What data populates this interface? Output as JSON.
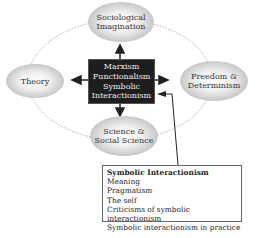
{
  "center": {
    "lines": [
      "Marxism",
      "Functionalism",
      "Symbolic",
      "Interactionism"
    ]
  },
  "nodes": {
    "top": {
      "lines": [
        "Sociological",
        "Imagination"
      ]
    },
    "left": {
      "lines": [
        "Theory"
      ]
    },
    "right": {
      "lines": [
        "Freedom &",
        "Determinism"
      ]
    },
    "bottom": {
      "lines": [
        "Science &",
        "Social Science"
      ]
    }
  },
  "info_box": {
    "title": "Symbolic Interactionism",
    "items": [
      "Meaning",
      "Pragmatism",
      "The self",
      "Criticisms of symbolic interactionism",
      "Symbolic interactionism in practice"
    ]
  }
}
